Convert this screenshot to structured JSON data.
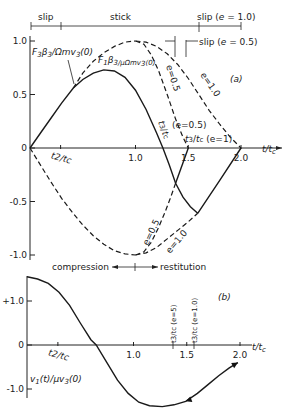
{
  "chart_data": [
    {
      "id": "a",
      "type": "line",
      "panel_label": "(a)",
      "xlabel": "t/t_c",
      "ylabel": "",
      "xlim": [
        0,
        2.1
      ],
      "ylim": [
        -1.0,
        1.0
      ],
      "x_ticks": [
        {
          "value": 0.29,
          "label": "t2/tc"
        },
        {
          "value": 1.0,
          "label": "1.0"
        },
        {
          "value": 1.5,
          "label": "1.5"
        },
        {
          "value": 2.0,
          "label": "2.0"
        }
      ],
      "y_ticks": [
        {
          "value": 1.0,
          "label": "1.0"
        },
        {
          "value": 0.5,
          "label": "0.5"
        },
        {
          "value": 0,
          "label": "0"
        },
        {
          "value": -0.5,
          "label": "-0.5"
        },
        {
          "value": -1.0,
          "label": "-1.0"
        }
      ],
      "series": [
        {
          "name": "F3 β3 / Ω m v3(0)",
          "style": "solid",
          "points": [
            [
              0,
              0
            ],
            [
              0.1,
              0.14
            ],
            [
              0.2,
              0.28
            ],
            [
              0.3,
              0.42
            ],
            [
              0.41,
              0.56
            ],
            [
              0.5,
              0.64
            ],
            [
              0.6,
              0.7
            ],
            [
              0.7,
              0.73
            ],
            [
              0.8,
              0.72
            ],
            [
              0.9,
              0.66
            ],
            [
              1.0,
              0.54
            ],
            [
              1.1,
              0.36
            ],
            [
              1.2,
              0.14
            ],
            [
              1.26,
              0
            ],
            [
              1.32,
              -0.16
            ],
            [
              1.38,
              -0.33
            ],
            [
              1.45,
              -0.46
            ],
            [
              1.52,
              -0.55
            ],
            [
              1.59,
              -0.61
            ]
          ]
        },
        {
          "name": "solid e=0.5 restitution",
          "style": "solid",
          "points": [
            [
              1.38,
              -0.33
            ],
            [
              1.5,
              0
            ]
          ]
        },
        {
          "name": "solid e=1.0 restitution",
          "style": "solid",
          "points": [
            [
              1.59,
              -0.61
            ],
            [
              1.8,
              -0.3
            ],
            [
              2.0,
              0
            ]
          ]
        },
        {
          "name": "F1 β3 / μ Ω m v3(0) (upper, compression)",
          "style": "dashed",
          "points": [
            [
              0.41,
              0.56
            ],
            [
              0.5,
              0.7
            ],
            [
              0.6,
              0.81
            ],
            [
              0.7,
              0.89
            ],
            [
              0.8,
              0.95
            ],
            [
              0.9,
              0.99
            ],
            [
              1.0,
              1.0
            ]
          ]
        },
        {
          "name": "upper e=0.5",
          "style": "dashed",
          "points": [
            [
              1.0,
              1.0
            ],
            [
              1.08,
              0.97
            ],
            [
              1.15,
              0.87
            ],
            [
              1.22,
              0.72
            ],
            [
              1.3,
              0.5
            ],
            [
              1.38,
              0.27
            ],
            [
              1.45,
              0.1
            ],
            [
              1.5,
              0
            ]
          ]
        },
        {
          "name": "upper e=1.0",
          "style": "dashed",
          "points": [
            [
              1.0,
              1.0
            ],
            [
              1.1,
              0.99
            ],
            [
              1.2,
              0.95
            ],
            [
              1.3,
              0.88
            ],
            [
              1.4,
              0.78
            ],
            [
              1.5,
              0.65
            ],
            [
              1.6,
              0.5
            ],
            [
              1.7,
              0.35
            ],
            [
              1.8,
              0.22
            ],
            [
              1.9,
              0.1
            ],
            [
              2.0,
              0
            ]
          ]
        },
        {
          "name": "lower compression",
          "style": "dashed",
          "points": [
            [
              0,
              0
            ],
            [
              0.1,
              -0.16
            ],
            [
              0.2,
              -0.32
            ],
            [
              0.3,
              -0.47
            ],
            [
              0.4,
              -0.6
            ],
            [
              0.5,
              -0.72
            ],
            [
              0.6,
              -0.82
            ],
            [
              0.7,
              -0.9
            ],
            [
              0.8,
              -0.96
            ],
            [
              0.9,
              -0.99
            ],
            [
              1.0,
              -1.0
            ]
          ]
        },
        {
          "name": "lower e=0.5",
          "style": "dashed",
          "points": [
            [
              1.0,
              -1.0
            ],
            [
              1.08,
              -0.97
            ],
            [
              1.15,
              -0.88
            ],
            [
              1.22,
              -0.74
            ],
            [
              1.28,
              -0.6
            ],
            [
              1.33,
              -0.47
            ],
            [
              1.38,
              -0.33
            ]
          ]
        },
        {
          "name": "lower e=1.0",
          "style": "dashed",
          "points": [
            [
              1.0,
              -1.0
            ],
            [
              1.1,
              -0.98
            ],
            [
              1.2,
              -0.93
            ],
            [
              1.3,
              -0.85
            ],
            [
              1.4,
              -0.77
            ],
            [
              1.5,
              -0.69
            ],
            [
              1.59,
              -0.61
            ]
          ]
        }
      ],
      "annotations": [
        {
          "text": "F3β3/Ωmv3(0)",
          "target": "solid"
        },
        {
          "text": "F1β3/μΩmv3(0)",
          "target": "dashed"
        },
        {
          "text": "e=0.5",
          "target": "upper e=0.5"
        },
        {
          "text": "e=1.0",
          "target": "upper e=1.0"
        },
        {
          "text": "e=0.5",
          "target": "lower e=0.5"
        },
        {
          "text": "e=1.0",
          "target": "lower e=1.0"
        },
        {
          "text": "t3/tc",
          "sub": "(e=0.5)",
          "x": 1.38
        },
        {
          "text": "t3/tc",
          "sub": "(e=1)",
          "x": 1.5
        },
        {
          "text": "compression",
          "direction": "left",
          "x": 1.0
        },
        {
          "text": "restitution",
          "direction": "right",
          "x": 1.0
        }
      ],
      "phase_bar": [
        {
          "label": "slip",
          "from": 0,
          "to": 0.29
        },
        {
          "label": "stick",
          "from": 0.29,
          "to": 1.6
        },
        {
          "label": "slip (e=1.0)",
          "from": 1.6,
          "to": 2.0
        },
        {
          "label": "slip (e=0.5)",
          "from": 1.38,
          "to": 1.5
        }
      ]
    },
    {
      "id": "b",
      "type": "line",
      "panel_label": "(b)",
      "xlabel": "t/t_c",
      "ylabel": "v1(t)/μv3(0)",
      "xlim": [
        0,
        2.1
      ],
      "ylim": [
        -1.4,
        1.6
      ],
      "x_ticks": [
        {
          "value": 0.29,
          "label": "t2/tc"
        },
        {
          "value": 1.0,
          "label": "1.0"
        },
        {
          "value": 1.5,
          "label": "1.5"
        },
        {
          "value": 2.0,
          "label": "2.0"
        }
      ],
      "y_ticks": [
        {
          "value": 1.0,
          "label": "+1.0"
        },
        {
          "value": 0,
          "label": "0"
        },
        {
          "value": -1.0,
          "label": "-1.0"
        }
      ],
      "series": [
        {
          "name": "v1(t)/μv3(0)",
          "style": "solid",
          "points": [
            [
              0,
              1.55
            ],
            [
              0.1,
              1.5
            ],
            [
              0.2,
              1.4
            ],
            [
              0.3,
              1.2
            ],
            [
              0.4,
              0.9
            ],
            [
              0.5,
              0.5
            ],
            [
              0.6,
              0.12
            ],
            [
              0.65,
              0
            ],
            [
              0.75,
              -0.4
            ],
            [
              0.85,
              -0.8
            ],
            [
              0.95,
              -1.1
            ],
            [
              1.05,
              -1.3
            ],
            [
              1.15,
              -1.38
            ],
            [
              1.27,
              -1.4
            ],
            [
              1.38,
              -1.36
            ],
            [
              1.49,
              -1.28
            ],
            [
              1.6,
              -1.1
            ],
            [
              1.7,
              -0.9
            ],
            [
              1.8,
              -0.7
            ],
            [
              1.9,
              -0.52
            ],
            [
              1.98,
              -0.4
            ]
          ]
        }
      ],
      "markers": [
        {
          "text": "t3/tc (e=5)",
          "x": 1.42
        },
        {
          "text": "t3/tc (e=1.0)",
          "x": 1.6
        }
      ]
    }
  ]
}
